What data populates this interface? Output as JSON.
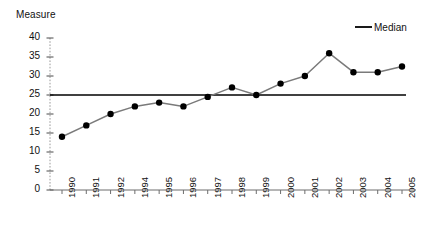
{
  "chart_data": {
    "type": "line",
    "title": "",
    "ylabel": "Measure",
    "xlabel": "",
    "categories": [
      "1990",
      "1991",
      "1992",
      "1994",
      "1995",
      "1996",
      "1997",
      "1998",
      "1999",
      "2000",
      "2001",
      "2002",
      "2003",
      "2004",
      "2005"
    ],
    "x_tick_labels": [
      "1990",
      "1991",
      "1992",
      "1994",
      "1995",
      "1996",
      "1997",
      "1998",
      "1999",
      "2000",
      "2001",
      "2002",
      "2003",
      "2004",
      "2005"
    ],
    "y_tick_labels": [
      "0",
      "5",
      "10",
      "15",
      "20",
      "25",
      "30",
      "35",
      "40"
    ],
    "y_ticks": [
      0,
      5,
      10,
      15,
      20,
      25,
      30,
      35,
      40
    ],
    "ylim": [
      0,
      40
    ],
    "grid": false,
    "legend": {
      "position": "top-right",
      "entries": [
        {
          "name": "Median",
          "color": "#000000",
          "style": "line"
        }
      ]
    },
    "series": [
      {
        "name": "Measure",
        "color": "#7a7a7a",
        "marker": "circle",
        "marker_color": "#000000",
        "values": [
          14,
          17,
          20,
          22,
          23,
          22,
          24.5,
          27,
          25,
          28,
          30,
          36,
          31,
          31,
          32.5
        ]
      }
    ],
    "reference_lines": [
      {
        "name": "Median",
        "value": 25,
        "color": "#000000"
      }
    ]
  },
  "legend": {
    "median_label": "Median"
  },
  "axes": {
    "y_axis_title": "Measure"
  }
}
